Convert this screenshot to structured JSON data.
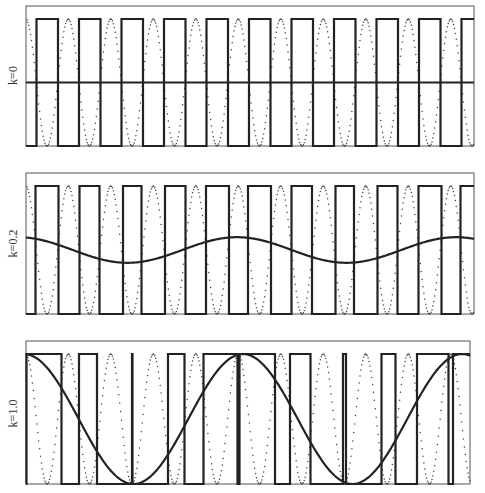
{
  "chart_data": [
    {
      "type": "line",
      "title": "",
      "ylabel": "k=0",
      "k": 0,
      "carrier_period_px": 42.5,
      "reference_period_px": 219,
      "series": [
        {
          "name": "carrier (dotted sinusoid)",
          "style": "dotted",
          "amplitude": 1.0
        },
        {
          "name": "reference signal",
          "style": "solid",
          "amplitude": 0.0
        },
        {
          "name": "PWM output (square wave)",
          "style": "solid-thick",
          "levels": [
            -1,
            1
          ],
          "duty_cycle": 0.5
        }
      ],
      "grid": false,
      "legend": "none",
      "ylim": [
        -1,
        1
      ]
    },
    {
      "type": "line",
      "title": "",
      "ylabel": "k=0.2",
      "k": 0.2,
      "carrier_period_px": 42.5,
      "reference_period_px": 219,
      "series": [
        {
          "name": "carrier (dotted sinusoid)",
          "style": "dotted",
          "amplitude": 1.0
        },
        {
          "name": "reference signal",
          "style": "solid",
          "amplitude": 0.2
        },
        {
          "name": "PWM output (square wave)",
          "style": "solid-thick",
          "levels": [
            -1,
            1
          ]
        }
      ],
      "grid": false,
      "legend": "none",
      "ylim": [
        -1,
        1
      ]
    },
    {
      "type": "line",
      "title": "",
      "ylabel": "k=1.0",
      "k": 1.0,
      "carrier_period_px": 42.5,
      "reference_period_px": 219,
      "series": [
        {
          "name": "carrier (dotted sinusoid)",
          "style": "dotted",
          "amplitude": 1.0
        },
        {
          "name": "reference signal",
          "style": "solid",
          "amplitude": 1.0
        },
        {
          "name": "PWM output (square wave)",
          "style": "solid-thick",
          "levels": [
            -1,
            1
          ]
        }
      ],
      "grid": false,
      "legend": "none",
      "ylim": [
        -1,
        1
      ]
    }
  ],
  "panels": [
    {
      "label": "k=0",
      "k": 0,
      "box": [
        26,
        6,
        474,
        146
      ],
      "sig_top": 19,
      "sig_bot": 146,
      "ref_phase_x": 24
    },
    {
      "label": "k=0.2",
      "k": 0.2,
      "box": [
        26,
        173,
        474,
        314
      ],
      "sig_top": 186,
      "sig_bot": 314,
      "ref_phase_x": 237
    },
    {
      "label": "k=1.0",
      "k": 1.0,
      "box": [
        26,
        341,
        470,
        484
      ],
      "sig_top": 354,
      "sig_bot": 484,
      "ref_phase_x": 24
    }
  ],
  "style": {
    "line_color": "#222222",
    "frame_color": "#555555"
  }
}
